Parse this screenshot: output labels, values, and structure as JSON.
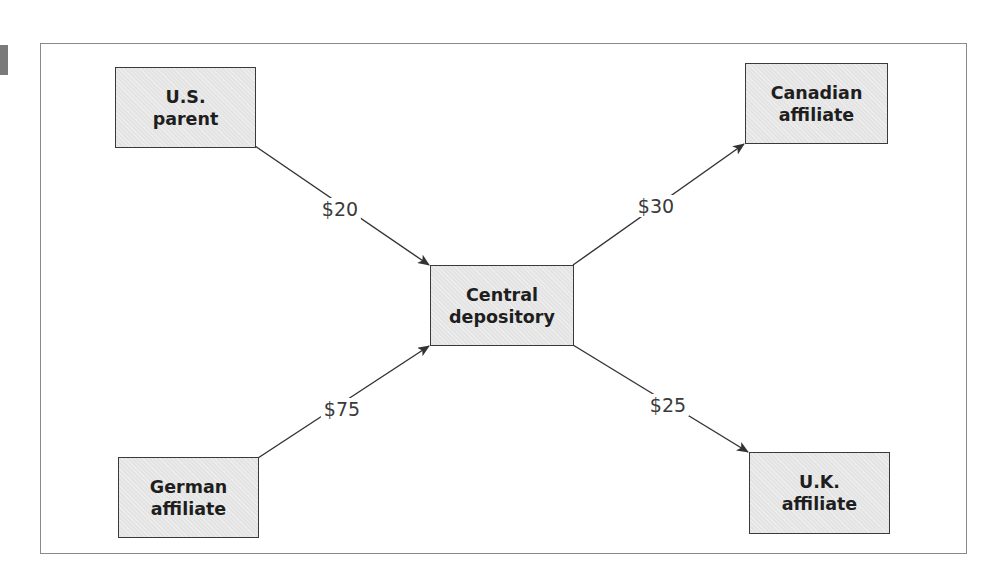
{
  "diagram": {
    "nodes": {
      "us_parent": {
        "line1": "U.S.",
        "line2": "parent"
      },
      "canadian": {
        "line1": "Canadian",
        "line2": "affiliate"
      },
      "central": {
        "line1": "Central",
        "line2": "depository"
      },
      "german": {
        "line1": "German",
        "line2": "affiliate"
      },
      "uk": {
        "line1": "U.K.",
        "line2": "affiliate"
      }
    },
    "flows": [
      {
        "from": "U.S. parent",
        "to": "Central depository",
        "label": "$20"
      },
      {
        "from": "Central depository",
        "to": "Canadian affiliate",
        "label": "$30"
      },
      {
        "from": "German affiliate",
        "to": "Central depository",
        "label": "$75"
      },
      {
        "from": "Central depository",
        "to": "U.K. affiliate",
        "label": "$25"
      }
    ],
    "colors": {
      "box_fill": "#e4e4e4",
      "box_border": "#3a3a3a",
      "frame": "#8a8a8a",
      "arrow": "#333333"
    }
  }
}
